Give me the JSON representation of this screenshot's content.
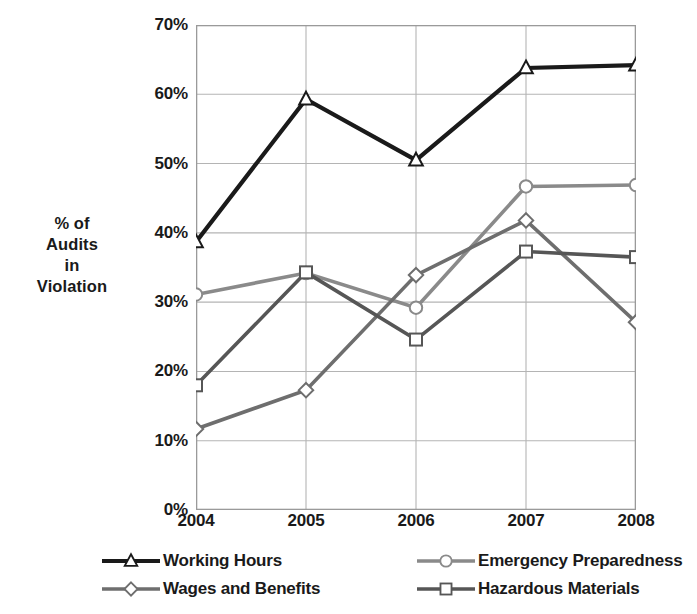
{
  "chart_data": {
    "type": "line",
    "title": "",
    "xlabel": "",
    "ylabel": "% of Audits in Violation",
    "ylabel_lines": [
      "% of",
      "Audits",
      "in",
      "Violation"
    ],
    "categories": [
      "2004",
      "2005",
      "2006",
      "2007",
      "2008"
    ],
    "ylim": [
      0,
      70
    ],
    "ytick_labels": [
      "0%",
      "10%",
      "20%",
      "30%",
      "40%",
      "50%",
      "60%",
      "70%"
    ],
    "ytick_values": [
      0,
      10,
      20,
      30,
      40,
      50,
      60,
      70
    ],
    "grid": true,
    "legend_position": "bottom",
    "series": [
      {
        "name": "Working Hours",
        "marker": "triangle",
        "color": "#1a1a1a",
        "values": [
          38.7,
          59.3,
          50.5,
          63.8,
          64.2
        ]
      },
      {
        "name": "Emergency Preparedness",
        "marker": "circle",
        "color": "#8a8a8a",
        "values": [
          31.1,
          34.2,
          29.2,
          46.7,
          46.9
        ]
      },
      {
        "name": "Wages and Benefits",
        "marker": "diamond",
        "color": "#6e6e6e",
        "values": [
          11.7,
          17.3,
          33.9,
          41.8,
          27.1
        ]
      },
      {
        "name": "Hazardous Materials",
        "marker": "square",
        "color": "#565656",
        "values": [
          18.0,
          34.3,
          24.6,
          37.3,
          36.5
        ]
      }
    ]
  },
  "legend": {
    "entries": [
      {
        "label": "Working Hours",
        "marker": "triangle",
        "color": "#1a1a1a"
      },
      {
        "label": "Emergency Preparedness",
        "marker": "circle",
        "color": "#8a8a8a"
      },
      {
        "label": "Wages and Benefits",
        "marker": "diamond",
        "color": "#6e6e6e"
      },
      {
        "label": "Hazardous Materials",
        "marker": "square",
        "color": "#565656"
      }
    ]
  },
  "style": {
    "plot_border_color": "#9a9a9a",
    "grid_color": "#b4b4b4",
    "background": "#ffffff",
    "marker_fill": "#ffffff"
  }
}
